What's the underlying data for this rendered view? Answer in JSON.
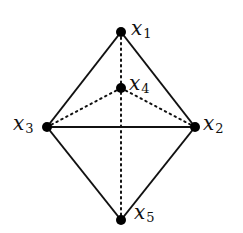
{
  "diagram": {
    "type": "graph",
    "nodes": [
      {
        "id": "x1",
        "var": "x",
        "sub": "1",
        "x": 121,
        "y": 32
      },
      {
        "id": "x2",
        "var": "x",
        "sub": "2",
        "x": 195,
        "y": 127
      },
      {
        "id": "x3",
        "var": "x",
        "sub": "3",
        "x": 47,
        "y": 127
      },
      {
        "id": "x4",
        "var": "x",
        "sub": "4",
        "x": 121,
        "y": 88
      },
      {
        "id": "x5",
        "var": "x",
        "sub": "5",
        "x": 121,
        "y": 220
      }
    ],
    "edges_solid": [
      [
        "x1",
        "x2"
      ],
      [
        "x1",
        "x3"
      ],
      [
        "x3",
        "x2"
      ],
      [
        "x3",
        "x5"
      ],
      [
        "x2",
        "x5"
      ]
    ],
    "edges_dotted": [
      [
        "x1",
        "x5"
      ],
      [
        "x4",
        "x3"
      ],
      [
        "x4",
        "x2"
      ]
    ],
    "colors": {
      "stroke": "#111111",
      "node": "#000000",
      "background": "#ffffff"
    }
  }
}
